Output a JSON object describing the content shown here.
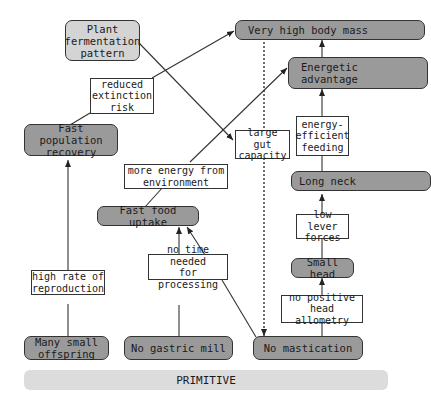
{
  "nodes": {
    "plant_fermentation": "Plant\nfermentation\npattern",
    "very_high_body_mass": "Very high body mass",
    "energetic_advantage": "Energetic\nadvantage",
    "fast_population_recovery": "Fast population\nrecovery",
    "fast_food_uptake": "Fast food uptake",
    "long_neck": "Long neck",
    "small_head": "Small head",
    "many_small_offspring": "Many small\noffspring",
    "no_gastric_mill": "No gastric mill",
    "no_mastication": "No mastication"
  },
  "labels": {
    "reduced_extinction_risk": "reduced\nextinction\nrisk",
    "large_gut_capacity": "large gut\ncapacity",
    "energy_efficient_feeding": "energy-\nefficient\nfeeding",
    "more_energy": "more energy from\nenvironment",
    "low_lever_forces": "low lever\nforces",
    "high_rate_reproduction": "high rate of\nreproduction",
    "no_time_needed": "no time needed\nfor processing",
    "no_positive_head_allometry": "no positive\nhead allometry"
  },
  "baseline": {
    "label": "PRIMITIVE"
  },
  "colors": {
    "node_dark": "#9a9a9a",
    "node_light": "#d4d4d4",
    "baseline": "#dcdcdc",
    "line": "#333333"
  }
}
